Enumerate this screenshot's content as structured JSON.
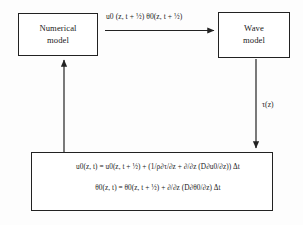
{
  "diagram": {
    "background_color": "#fdfdfd",
    "line_color": "#222222",
    "nodes": [
      {
        "id": "numerical-model",
        "label": "Numerical\nmodel"
      },
      {
        "id": "wave-model",
        "label": "Wave\nmodel"
      }
    ],
    "edges": [
      {
        "id": "numerical-to-wave",
        "from": "numerical-model",
        "to": "wave-model",
        "direction": "right",
        "label": "u0 (z, t + ½) θ0(z, t + ½)"
      },
      {
        "id": "wave-to-equations",
        "from": "wave-model",
        "to": "equations-box",
        "direction": "down",
        "label": "τ(z)"
      },
      {
        "id": "equations-to-numerical",
        "from": "equations-box",
        "to": "numerical-model",
        "direction": "up",
        "label": ""
      }
    ],
    "equations_box": {
      "id": "equations-box",
      "lines": [
        "u0(z, t) = u0(z, t + ½) + (1/ρ∂τ/∂z + ∂/∂z (D∂u0/∂z)) Δt",
        "θ0(z, t) = θ0(z, t + ½) + ∂/∂z (D∂θ0/∂z) Δt"
      ]
    }
  }
}
